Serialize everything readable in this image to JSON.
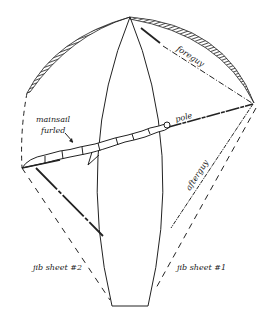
{
  "diagram": {
    "labels": {
      "mainsail": "mainsail",
      "furled": "furled",
      "foreguy": "foreguy",
      "pole": "pole",
      "afterguy": "afterguy",
      "jib_sheet_2": "jib sheet #2",
      "jib_sheet_1": "jib sheet #1"
    },
    "colors": {
      "ink": "#222222",
      "background": "#ffffff"
    }
  }
}
